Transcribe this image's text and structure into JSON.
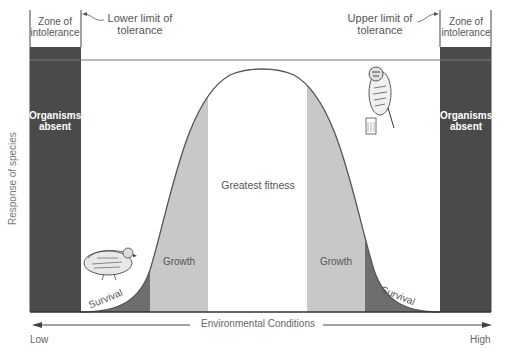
{
  "diagram": {
    "y_axis_label": "Response of species",
    "x_axis": {
      "label": "Environmental Conditions",
      "low_label": "Low",
      "high_label": "High"
    },
    "zones": {
      "left_intolerance": "Zone of intolerance",
      "right_intolerance": "Zone of intolerance",
      "lower_limit": "Lower limit of tolerance",
      "upper_limit": "Upper limit of tolerance",
      "left_absent": "Organisms absent",
      "right_absent": "Organisms absent",
      "left_survival": "Survival",
      "left_growth": "Growth",
      "greatest_fitness": "Greatest fitness",
      "right_growth": "Growth",
      "right_survival": "Survival"
    },
    "colors": {
      "intolerance": "#4a4a4a",
      "survival": "#6e6e6e",
      "growth": "#c8c8c8",
      "fitness": "#ffffff",
      "curve": "#555555"
    },
    "illustrations": [
      "quail-crouching-icon",
      "quail-perched-icon"
    ]
  }
}
